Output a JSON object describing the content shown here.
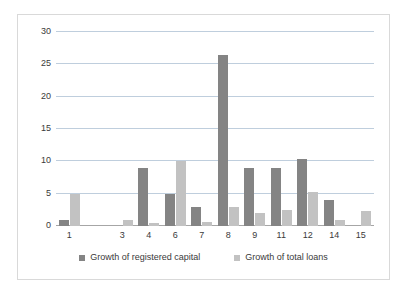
{
  "chart_data": {
    "type": "bar",
    "title": "",
    "subtitle": "",
    "xlabel": "",
    "ylabel": "",
    "categories": [
      "1",
      "",
      "3",
      "4",
      "6",
      "7",
      "8",
      "9",
      "11",
      "12",
      "14",
      "15"
    ],
    "tick_labels": [
      "1",
      "",
      "3",
      "4",
      "6",
      "7",
      "8",
      "9",
      "11",
      "12",
      "14",
      "15"
    ],
    "series": [
      {
        "name": "Growth of registered capital",
        "color": "#848484",
        "values": [
          1.0,
          0,
          0,
          9.0,
          5.0,
          3.0,
          26.5,
          9.0,
          9.0,
          10.4,
          4.0,
          0
        ]
      },
      {
        "name": "Growth of total loans",
        "color": "#c2c2c2",
        "values": [
          5.0,
          0,
          0.9,
          0.4,
          10.0,
          0.6,
          3.0,
          2.0,
          2.5,
          5.3,
          1.0,
          2.3
        ]
      }
    ],
    "ylim": [
      0,
      30
    ],
    "yticks": [
      0,
      5,
      10,
      15,
      20,
      25,
      30
    ],
    "ytick_labels": [
      "0",
      "5",
      "10",
      "15",
      "20",
      "25",
      "30"
    ],
    "grid": true,
    "grid_axis": "y",
    "legend_position": "bottom",
    "colors": {
      "gridline": "#bfcedd",
      "axis": "#a6a6a6",
      "plot_background": "#ffffff",
      "frame_border": "#d9d9d9",
      "text": "#3a3a3a"
    }
  }
}
